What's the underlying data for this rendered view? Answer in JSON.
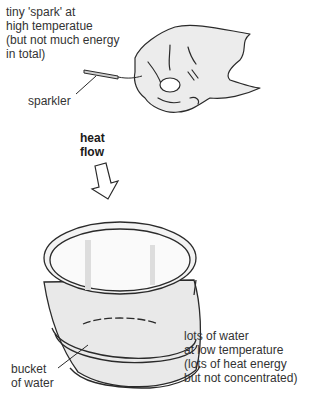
{
  "diagram": {
    "labels": {
      "spark_note": [
        "tiny 'spark' at",
        "high temperatue",
        "(but not much energy",
        "in total)"
      ],
      "sparkler": "sparkler",
      "heat_flow": [
        "heat",
        "flow"
      ],
      "bucket": [
        "bucket",
        "of water"
      ],
      "water_note": [
        "lots of water",
        "at low temperature",
        "(lots of heat energy",
        "but not concentrated)"
      ]
    },
    "icons": {
      "hand": "hand-holding-sparkler",
      "arrow": "hollow-down-arrow",
      "bucket": "bucket-of-water"
    },
    "colors": {
      "line": "#2a2a2a",
      "shade": "#d9d9d9",
      "background": "#ffffff"
    }
  }
}
